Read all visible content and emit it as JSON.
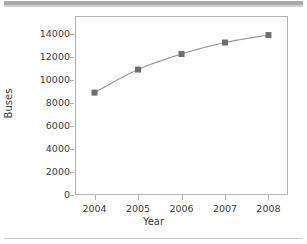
{
  "figure": {
    "background_color": "#ffffff",
    "frame_color": "#b4b4b4",
    "top_band_color": "#aaaaaa",
    "bottom_rule_color": "#cfcfcf"
  },
  "axis": {
    "xlabel": "Year",
    "ylabel": "Buses"
  },
  "chart_data": {
    "type": "line",
    "title": "",
    "xlabel": "Year",
    "ylabel": "Buses",
    "categories": [
      "2004",
      "2005",
      "2006",
      "2007",
      "2008"
    ],
    "x": [
      2004,
      2005,
      2006,
      2007,
      2008
    ],
    "values": [
      8900,
      10900,
      12250,
      13250,
      13900
    ],
    "series": [
      {
        "name": "Buses",
        "values": [
          8900,
          10900,
          12250,
          13250,
          13900
        ],
        "line_color": "#9a9a9a",
        "marker": "square",
        "marker_color": "#6e6e6e"
      }
    ],
    "ylim": [
      0,
      15555
    ],
    "xlim": [
      2003.55,
      2008.45
    ],
    "yticks": [
      0,
      2000,
      4000,
      6000,
      8000,
      10000,
      12000,
      14000
    ],
    "ytick_labels": [
      "0",
      "2000",
      "4000",
      "6000",
      "8000",
      "10000",
      "12000",
      "14000"
    ],
    "xticks": [
      2004,
      2005,
      2006,
      2007,
      2008
    ],
    "xtick_labels": [
      "2004",
      "2005",
      "2006",
      "2007",
      "2008"
    ],
    "grid": false,
    "legend": false,
    "legend_position": "none"
  }
}
